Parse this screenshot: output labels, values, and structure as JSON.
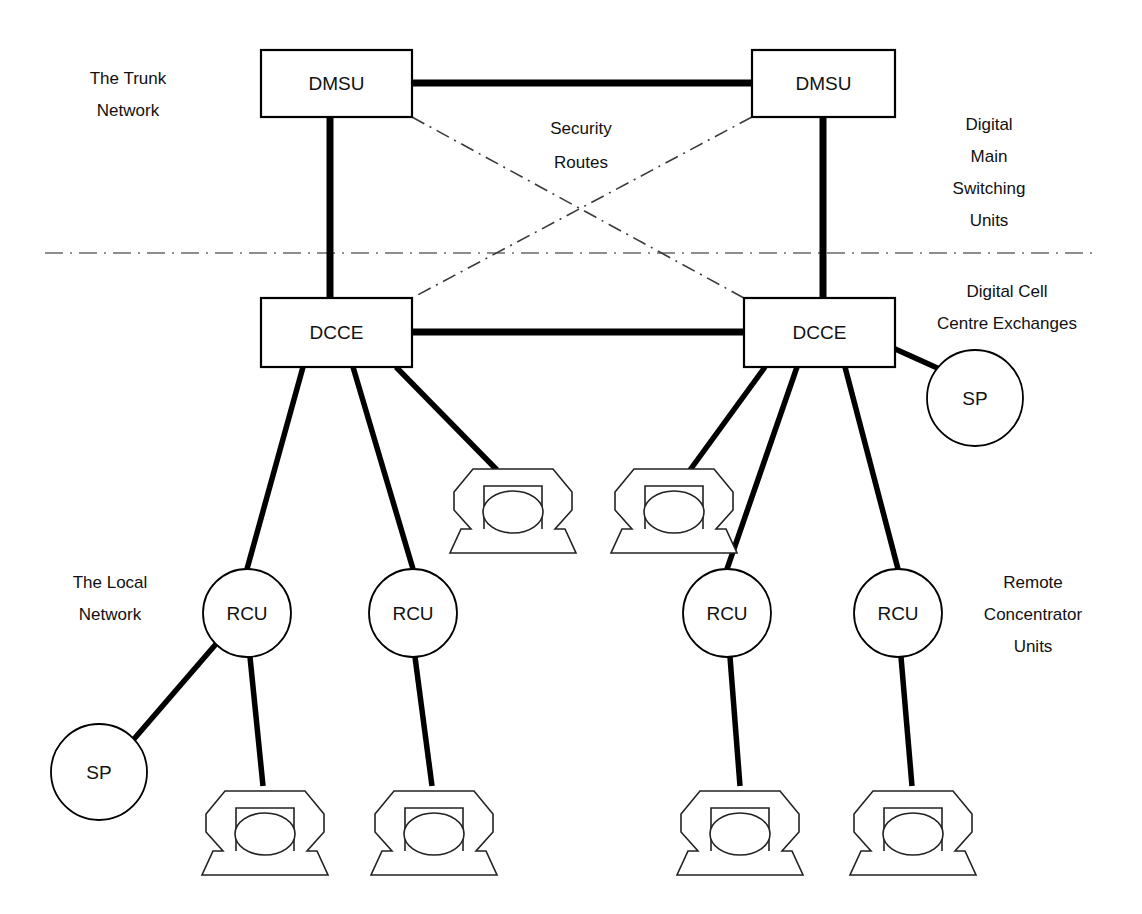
{
  "diagram": {
    "colors": {
      "line": "#000000",
      "security_route": "#3b3b3b",
      "divider": "#6a6a6a",
      "background": "#ffffff",
      "text": "#111111"
    }
  },
  "labels": {
    "trunk_network": {
      "line1": "The Trunk",
      "line2": "Network"
    },
    "local_network": {
      "line1": "The Local",
      "line2": "Network"
    },
    "dmsu_legend": {
      "line1": "Digital",
      "line2": "Main",
      "line3": "Switching",
      "line4": "Units"
    },
    "dcce_legend": {
      "line1": "Digital Cell",
      "line2": "Centre Exchanges"
    },
    "rcu_legend": {
      "line1": "Remote",
      "line2": "Concentrator",
      "line3": "Units"
    },
    "security_routes": {
      "line1": "Security",
      "line2": "Routes"
    }
  },
  "nodes": {
    "dmsu": [
      {
        "id": "dmsu-left",
        "label": "DMSU",
        "x": 261,
        "y": 50,
        "w": 151,
        "h": 67
      },
      {
        "id": "dmsu-right",
        "label": "DMSU",
        "x": 752,
        "y": 50,
        "w": 143,
        "h": 67
      }
    ],
    "dcce": [
      {
        "id": "dcce-left",
        "label": "DCCE",
        "x": 261,
        "y": 298,
        "w": 151,
        "h": 69
      },
      {
        "id": "dcce-right",
        "label": "DCCE",
        "x": 744,
        "y": 298,
        "w": 151,
        "h": 69
      }
    ],
    "rcu": [
      {
        "id": "rcu-1",
        "label": "RCU",
        "cx": 247,
        "cy": 613,
        "r": 44
      },
      {
        "id": "rcu-2",
        "label": "RCU",
        "cx": 413,
        "cy": 613,
        "r": 44
      },
      {
        "id": "rcu-3",
        "label": "RCU",
        "cx": 727,
        "cy": 613,
        "r": 44
      },
      {
        "id": "rcu-4",
        "label": "RCU",
        "cx": 898,
        "cy": 613,
        "r": 44
      }
    ],
    "sp": [
      {
        "id": "sp-right",
        "label": "SP",
        "cx": 975,
        "cy": 398,
        "r": 48
      },
      {
        "id": "sp-left",
        "label": "SP",
        "cx": 99,
        "cy": 772,
        "r": 48
      }
    ],
    "phones": [
      {
        "id": "phone-mid-left",
        "cx": 513,
        "cy": 508,
        "scale": 1.0
      },
      {
        "id": "phone-mid-right",
        "cx": 674,
        "cy": 508,
        "scale": 1.0
      },
      {
        "id": "phone-bot-1",
        "cx": 265,
        "cy": 830,
        "scale": 1.0
      },
      {
        "id": "phone-bot-2",
        "cx": 434,
        "cy": 830,
        "scale": 1.0
      },
      {
        "id": "phone-bot-3",
        "cx": 740,
        "cy": 830,
        "scale": 1.0
      },
      {
        "id": "phone-bot-4",
        "cx": 913,
        "cy": 830,
        "scale": 1.0
      }
    ]
  },
  "connections": {
    "trunk": [
      {
        "from": "dmsu-left",
        "to": "dmsu-right",
        "style": "solid-thick"
      },
      {
        "from": "dmsu-left",
        "to": "dcce-left",
        "style": "solid-thick"
      },
      {
        "from": "dmsu-right",
        "to": "dcce-right",
        "style": "solid-thick"
      },
      {
        "from": "dcce-left",
        "to": "dcce-right",
        "style": "solid-thick"
      }
    ],
    "security": [
      {
        "from": "dmsu-left",
        "to": "dcce-right",
        "style": "dash-dot"
      },
      {
        "from": "dmsu-right",
        "to": "dcce-left",
        "style": "dash-dot"
      }
    ],
    "local": [
      {
        "from": "dcce-left",
        "to": "rcu-1"
      },
      {
        "from": "dcce-left",
        "to": "rcu-2"
      },
      {
        "from": "dcce-left",
        "to": "phone-mid-left"
      },
      {
        "from": "dcce-right",
        "to": "phone-mid-right"
      },
      {
        "from": "dcce-right",
        "to": "rcu-3"
      },
      {
        "from": "dcce-right",
        "to": "rcu-4"
      },
      {
        "from": "dcce-right",
        "to": "sp-right"
      },
      {
        "from": "rcu-1",
        "to": "sp-left"
      },
      {
        "from": "rcu-1",
        "to": "phone-bot-1"
      },
      {
        "from": "rcu-2",
        "to": "phone-bot-2"
      },
      {
        "from": "rcu-3",
        "to": "phone-bot-3"
      },
      {
        "from": "rcu-4",
        "to": "phone-bot-4"
      }
    ]
  },
  "divider": {
    "x1": 45,
    "x2": 1096,
    "y": 253
  }
}
